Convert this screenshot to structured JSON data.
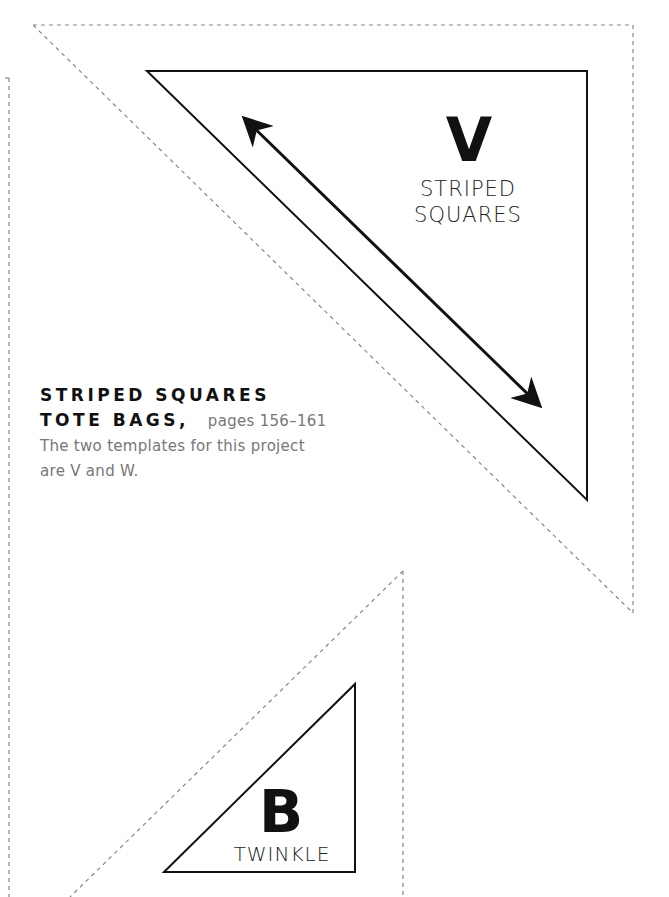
{
  "templates": [
    {
      "id": "V",
      "letter": "V",
      "name_line1": "STRIPED",
      "name_line2": "SQUARES"
    },
    {
      "id": "B",
      "letter": "B",
      "name": "TWINKLE"
    }
  ],
  "caption": {
    "title_line1": "STRIPED SQUARES",
    "title_line2": "TOTE BAGS",
    "separator": ",",
    "pages": "pages 156–161",
    "description_line1": "The two templates for this project",
    "description_line2": "are V and W."
  },
  "colors": {
    "cut_line": "#111111",
    "seam_dashed": "#888888",
    "caption_gray": "#777777"
  }
}
